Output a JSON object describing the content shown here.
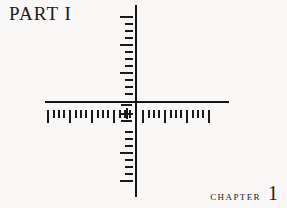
{
  "page": {
    "background_color": "#f9f8f7",
    "ink_color": "#1a1a1a",
    "width": 287,
    "height": 208
  },
  "part": {
    "label": "PART I"
  },
  "chapter": {
    "word": "Chapter",
    "number": "1"
  },
  "figure": {
    "name": "crosshair-ruler-diagram",
    "axes": {
      "horizontal": {
        "x": 45,
        "y": 101,
        "length": 184,
        "thickness": 2.4
      },
      "vertical": {
        "x": 135,
        "y": 5,
        "length": 192,
        "thickness": 2.4
      }
    },
    "center": {
      "x": 136,
      "y": 102
    },
    "reticle": {
      "name": "center-plus-mark"
    },
    "horizontal_ruler": {
      "baseline_y": 110,
      "major_height": 13,
      "minor_height": 8,
      "spacing": 4.6,
      "group_size": 4,
      "ticks": [
        {
          "x": 47,
          "kind": "major"
        },
        {
          "x": 53,
          "kind": "minor"
        },
        {
          "x": 58,
          "kind": "minor"
        },
        {
          "x": 63,
          "kind": "minor"
        },
        {
          "x": 69,
          "kind": "major"
        },
        {
          "x": 75,
          "kind": "minor"
        },
        {
          "x": 80,
          "kind": "minor"
        },
        {
          "x": 85,
          "kind": "minor"
        },
        {
          "x": 91,
          "kind": "major"
        },
        {
          "x": 97,
          "kind": "minor"
        },
        {
          "x": 102,
          "kind": "minor"
        },
        {
          "x": 107,
          "kind": "minor"
        },
        {
          "x": 113,
          "kind": "major"
        },
        {
          "x": 119,
          "kind": "minor"
        },
        {
          "x": 124,
          "kind": "minor"
        },
        {
          "x": 129,
          "kind": "minor"
        },
        {
          "x": 142,
          "kind": "major"
        },
        {
          "x": 148,
          "kind": "minor"
        },
        {
          "x": 153,
          "kind": "minor"
        },
        {
          "x": 158,
          "kind": "minor"
        },
        {
          "x": 164,
          "kind": "major"
        },
        {
          "x": 170,
          "kind": "minor"
        },
        {
          "x": 175,
          "kind": "minor"
        },
        {
          "x": 180,
          "kind": "minor"
        },
        {
          "x": 186,
          "kind": "major"
        },
        {
          "x": 192,
          "kind": "minor"
        },
        {
          "x": 197,
          "kind": "minor"
        },
        {
          "x": 202,
          "kind": "minor"
        },
        {
          "x": 208,
          "kind": "major"
        }
      ]
    },
    "vertical_ruler": {
      "baseline_x": 120,
      "major_width": 13,
      "minor_width": 8,
      "spacing": 7.4,
      "group_size": 4,
      "ticks": [
        {
          "y": 16,
          "kind": "major"
        },
        {
          "y": 23,
          "kind": "minor"
        },
        {
          "y": 30,
          "kind": "minor"
        },
        {
          "y": 37,
          "kind": "minor"
        },
        {
          "y": 44,
          "kind": "major"
        },
        {
          "y": 51,
          "kind": "minor"
        },
        {
          "y": 58,
          "kind": "minor"
        },
        {
          "y": 65,
          "kind": "minor"
        },
        {
          "y": 72,
          "kind": "major"
        },
        {
          "y": 79,
          "kind": "minor"
        },
        {
          "y": 86,
          "kind": "minor"
        },
        {
          "y": 93,
          "kind": "minor"
        },
        {
          "y": 131,
          "kind": "minor"
        },
        {
          "y": 138,
          "kind": "minor"
        },
        {
          "y": 145,
          "kind": "minor"
        },
        {
          "y": 152,
          "kind": "major"
        },
        {
          "y": 159,
          "kind": "minor"
        },
        {
          "y": 166,
          "kind": "minor"
        },
        {
          "y": 173,
          "kind": "minor"
        },
        {
          "y": 180,
          "kind": "major"
        }
      ]
    }
  }
}
